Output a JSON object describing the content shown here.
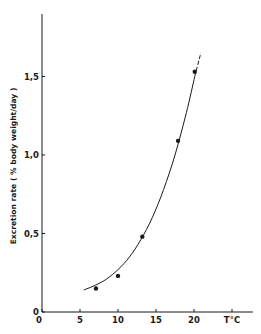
{
  "chart_data": {
    "type": "scatter",
    "title": "",
    "xlabel": "T°C",
    "ylabel": "Excretion rate ( % body weight/day )",
    "xlim": [
      0,
      25
    ],
    "ylim": [
      0,
      1.75
    ],
    "x_ticks": [
      0,
      5,
      10,
      15,
      20,
      25
    ],
    "x_tick_labels": [
      "0",
      "5",
      "10",
      "15",
      "20",
      "T°C"
    ],
    "y_ticks": [
      0,
      0.5,
      1.0,
      1.5
    ],
    "y_tick_labels": [
      "0",
      "0,5",
      "1,0",
      "1,5"
    ],
    "grid": false,
    "legend": null,
    "series": [
      {
        "name": "Observed",
        "type": "scatter",
        "x": [
          7.1,
          10.0,
          13.2,
          17.9,
          20.1
        ],
        "y": [
          0.15,
          0.23,
          0.48,
          1.09,
          1.53
        ]
      },
      {
        "name": "Fitted curve",
        "type": "line",
        "x": [
          5.5,
          7,
          8.5,
          10,
          11.5,
          13,
          14.5,
          16,
          17.5,
          19,
          20.1
        ],
        "y": [
          0.14,
          0.17,
          0.21,
          0.27,
          0.35,
          0.46,
          0.6,
          0.78,
          1.0,
          1.27,
          1.5
        ]
      },
      {
        "name": "Extrapolated (dashed)",
        "type": "line",
        "style": "dashed",
        "x": [
          20.1,
          20.9
        ],
        "y": [
          1.5,
          1.65
        ]
      }
    ]
  },
  "labels": {
    "y_axis_title": "Excretion rate ( % body weight/day )",
    "x_unit": "T°C",
    "x_ticks": [
      "0",
      "5",
      "10",
      "15",
      "20",
      "T°C"
    ],
    "y_ticks": [
      "0",
      "0,5",
      "1,0",
      "1,5"
    ]
  },
  "style": {
    "ink": "#1a1a1a",
    "background": "#ffffff"
  }
}
